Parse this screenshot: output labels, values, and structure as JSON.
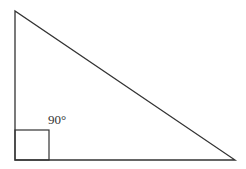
{
  "diagram": {
    "type": "right-triangle",
    "vertices": {
      "top": [
        15,
        11
      ],
      "bottom_left": [
        15,
        160
      ],
      "bottom_right": [
        235,
        160
      ]
    },
    "right_angle_marker": {
      "x": 15,
      "y": 130,
      "size": 31
    },
    "angle_label": "90°",
    "stroke_color": "#333333"
  }
}
